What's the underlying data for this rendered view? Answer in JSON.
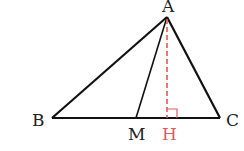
{
  "diagram": {
    "type": "geometry-triangle",
    "points": {
      "A": {
        "label": "A",
        "x": 167,
        "y": 17
      },
      "B": {
        "label": "B",
        "x": 52,
        "y": 118
      },
      "C": {
        "label": "C",
        "x": 220,
        "y": 118
      },
      "M": {
        "label": "M",
        "x": 136,
        "y": 118
      },
      "H": {
        "label": "H",
        "x": 167,
        "y": 118
      }
    },
    "segments": [
      {
        "from": "A",
        "to": "B",
        "style": "solid"
      },
      {
        "from": "A",
        "to": "C",
        "style": "solid"
      },
      {
        "from": "B",
        "to": "C",
        "style": "solid"
      },
      {
        "from": "A",
        "to": "M",
        "style": "solid"
      },
      {
        "from": "A",
        "to": "H",
        "style": "dashed",
        "color": "#e05a5a"
      }
    ],
    "right_angle_at": "H",
    "colors": {
      "line": "#111111",
      "altitude": "#e05a5a",
      "label": "#222222",
      "highlight_label": "#e05a5a"
    }
  }
}
